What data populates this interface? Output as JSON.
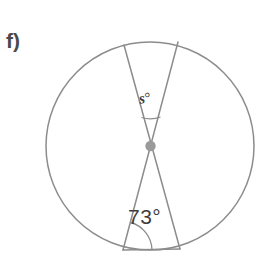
{
  "figure": {
    "part_label": "f)",
    "stroke_color": "#8c8c8c",
    "center_dot_color": "#9a9a9a",
    "background_color": "#ffffff",
    "text_color": "#3d3d3d",
    "circle": {
      "cx": 150,
      "cy": 146,
      "r": 104
    },
    "center_point": {
      "cx": 150.5,
      "cy": 146,
      "r": 5.2
    },
    "chords": [
      {
        "name": "chord-top-left-to-bottom-right",
        "x1": 124,
        "y1": 45,
        "x2": 180,
        "y2": 249
      },
      {
        "name": "chord-top-right-to-bottom-left",
        "x1": 178,
        "y1": 42,
        "x2": 123,
        "y2": 250
      },
      {
        "name": "chord-bottom-base",
        "x1": 123,
        "y1": 250,
        "x2": 180,
        "y2": 249
      }
    ],
    "angles": [
      {
        "name": "angle-s-upper",
        "label": "s",
        "unit": "°",
        "vertex": "centre",
        "arc": true
      },
      {
        "name": "angle-73-lower-left",
        "label": "73",
        "unit": "°",
        "vertex": "bottom-left-chord-endpoint",
        "arc": true
      }
    ]
  }
}
